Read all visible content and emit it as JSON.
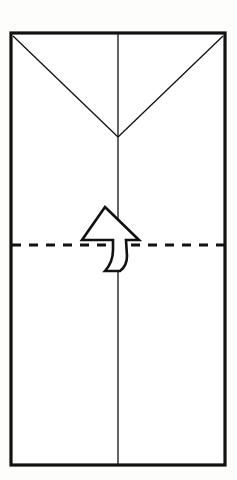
{
  "figure": {
    "caption": "",
    "background_color": "#fdfdfb",
    "ink_color": "#111111",
    "paper_fill": "#ffffff",
    "width": 237,
    "height": 480
  },
  "paper": {
    "name": "folded-paper-sheet",
    "shape": "rectangle",
    "left": 11,
    "top": 33,
    "right": 225,
    "bottom": 465,
    "stroke_width": 3.2,
    "stroke_color": "#111111",
    "fill_color": "#ffffff"
  },
  "creases": [
    {
      "name": "vertical-center-crease",
      "type": "existing-crease",
      "style": "solid",
      "x1": 118,
      "y1": 34,
      "x2": 118,
      "y2": 464,
      "stroke_width": 1.3
    },
    {
      "name": "left-diagonal-crease",
      "type": "existing-crease",
      "style": "solid",
      "x1": 13,
      "y1": 36,
      "x2": 118,
      "y2": 137,
      "stroke_width": 1.3
    },
    {
      "name": "right-diagonal-crease",
      "type": "existing-crease",
      "style": "solid",
      "x1": 223,
      "y1": 36,
      "x2": 118,
      "y2": 137,
      "stroke_width": 1.3
    }
  ],
  "fold_line": {
    "name": "horizontal-valley-fold-line",
    "type": "valley-fold",
    "style": "dashed",
    "x1": 12,
    "y1": 245,
    "x2": 224,
    "y2": 245,
    "stroke_width": 3.2,
    "dash_length": 9,
    "gap_length": 8
  },
  "arrow": {
    "name": "fold-up-arrow",
    "direction": "up",
    "style": "hollow-curved-outline",
    "fill": "#ffffff",
    "stroke": "#111111",
    "stroke_width": 2.6,
    "tip_x": 105,
    "tip_y": 207,
    "tail_y": 272,
    "path": "M 105 207 L 139 240 L 126 240 L 127 256 Q 127 266 120 271 L 105 271 Q 113 262 113 250 L 113 240 L 82 240 Z"
  },
  "apex": {
    "name": "v-crease-apex",
    "x": 118,
    "y": 137
  }
}
